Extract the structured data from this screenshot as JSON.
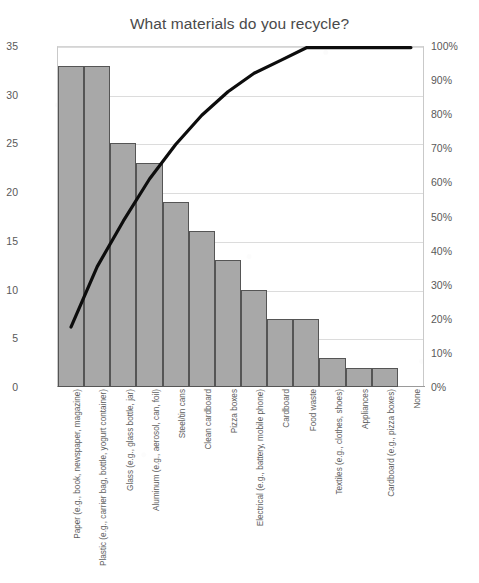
{
  "chart_data": {
    "type": "bar",
    "title": "What materials do you recycle?",
    "xlabel": "",
    "ylabel": "",
    "grid": true,
    "legend_position": "none",
    "categories": [
      "Paper (e.g., book, newspaper, magazine)",
      "Plastic (e.g., carrier bag, bottle, yogurt container)",
      "Glass (e.g., glass bottle, jar)",
      "Aluminum (e.g., aerosol, can, foil)",
      "Steel/tin cans",
      "Clean cardboard",
      "Pizza boxes",
      "Electrical (e.g., battery, mobile phone)",
      "Cardboard",
      "Food waste",
      "Textiles (e.g., clothes, shoes)",
      "Appliances",
      "Cardboard (e.g., pizza boxes)",
      "None"
    ],
    "values": [
      33,
      33,
      25,
      23,
      19,
      16,
      13,
      10,
      7,
      7,
      3,
      2,
      2,
      0
    ],
    "ylim": [
      0,
      35
    ],
    "ytick_labels": [
      "0",
      "5",
      "10",
      "15",
      "20",
      "25",
      "30",
      "35"
    ],
    "ytick_values": [
      0,
      5,
      10,
      15,
      20,
      25,
      30,
      35
    ],
    "secondary_axis": {
      "name": "Cumulative percentage",
      "ylim": [
        0,
        100
      ],
      "ytick_labels": [
        "0%",
        "10%",
        "20%",
        "30%",
        "40%",
        "50%",
        "60%",
        "70%",
        "80%",
        "90%",
        "100%"
      ],
      "ytick_values": [
        0,
        10,
        20,
        30,
        40,
        50,
        60,
        70,
        80,
        90,
        100
      ]
    },
    "series": [
      {
        "name": "Count",
        "type": "bar",
        "color": "#a8a8a8",
        "values": [
          33,
          33,
          25,
          23,
          19,
          16,
          13,
          10,
          7,
          7,
          3,
          2,
          2,
          0
        ]
      },
      {
        "name": "Cumulative %",
        "type": "line",
        "axis": "secondary",
        "color": "#000000",
        "values": [
          17.6,
          35.3,
          48.7,
          61.0,
          71.1,
          79.7,
          86.6,
          92.0,
          95.7,
          99.5,
          101.1,
          102.1,
          103.2,
          103.2
        ]
      }
    ],
    "total": 193
  },
  "footer": {
    "scan_note": ""
  }
}
